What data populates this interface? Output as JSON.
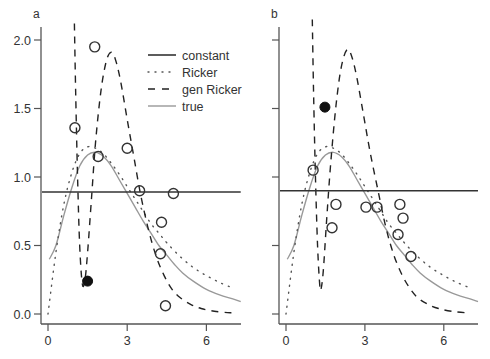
{
  "colors": {
    "axis": "#555555",
    "constant": "#333333",
    "ricker": "#555555",
    "gen_ricker": "#222222",
    "true": "#999999",
    "point_open": "#333333",
    "point_filled": "#111111"
  },
  "legend": {
    "entries": [
      {
        "label": "constant",
        "style": "solid"
      },
      {
        "label": "Ricker",
        "style": "dotted"
      },
      {
        "label": "gen Ricker",
        "style": "dashed"
      },
      {
        "label": "true",
        "style": "solid-gray"
      }
    ],
    "panel": "a"
  },
  "chart_data": [
    {
      "type": "scatter",
      "panel_label": "a",
      "title": "",
      "xlabel": "",
      "ylabel": "",
      "xlim": [
        -0.3,
        7.3
      ],
      "ylim": [
        -0.06,
        2.1
      ],
      "x_ticks": [
        0,
        3,
        6
      ],
      "y_ticks": [
        0.0,
        0.5,
        1.0,
        1.5,
        2.0
      ],
      "y_tick_labels": [
        "0.0",
        "0.5",
        "1.0",
        "1.5",
        "2.0"
      ],
      "grid": false,
      "legend_position": "upper right",
      "points_open": [
        [
          1.02,
          1.36
        ],
        [
          1.77,
          1.95
        ],
        [
          1.9,
          1.15
        ],
        [
          3.0,
          1.21
        ],
        [
          3.47,
          0.9
        ],
        [
          4.75,
          0.88
        ],
        [
          4.3,
          0.67
        ],
        [
          4.26,
          0.44
        ],
        [
          4.45,
          0.06
        ]
      ],
      "points_filled": [
        [
          1.5,
          0.24
        ]
      ],
      "series": [
        {
          "name": "constant",
          "x": [
            -0.3,
            7.3
          ],
          "y": [
            0.89,
            0.89
          ]
        },
        {
          "name": "Ricker",
          "x": [
            0,
            0.3,
            0.6,
            0.9,
            1.2,
            1.5,
            1.8,
            2.1,
            2.4,
            2.7,
            3.0,
            3.3,
            3.6,
            3.9,
            4.2,
            4.5,
            5.0,
            5.5,
            6.0,
            6.5,
            7.0
          ],
          "y": [
            0.0,
            0.45,
            0.8,
            1.03,
            1.17,
            1.22,
            1.21,
            1.17,
            1.1,
            1.02,
            0.93,
            0.84,
            0.75,
            0.66,
            0.59,
            0.52,
            0.42,
            0.34,
            0.28,
            0.23,
            0.19
          ]
        },
        {
          "name": "gen Ricker",
          "x": [
            1.0,
            1.05,
            1.12,
            1.2,
            1.3,
            1.4,
            1.5,
            1.65,
            1.8,
            2.0,
            2.2,
            2.38,
            2.55,
            2.75,
            3.0,
            3.25,
            3.5,
            3.8,
            4.1,
            4.4,
            4.7,
            5.0,
            5.4,
            5.8,
            6.3,
            6.8,
            7.0
          ],
          "y": [
            2.12,
            1.6,
            1.0,
            0.5,
            0.22,
            0.25,
            0.45,
            0.85,
            1.25,
            1.62,
            1.84,
            1.91,
            1.86,
            1.7,
            1.42,
            1.15,
            0.88,
            0.62,
            0.42,
            0.28,
            0.18,
            0.12,
            0.07,
            0.04,
            0.02,
            0.01,
            0.01
          ]
        },
        {
          "name": "true",
          "x": [
            0.05,
            0.3,
            0.6,
            0.9,
            1.2,
            1.5,
            1.8,
            2.1,
            2.4,
            2.7,
            3.0,
            3.3,
            3.6,
            3.9,
            4.2,
            4.5,
            4.8,
            5.1,
            5.5,
            6.0,
            6.5,
            7.0,
            7.3
          ],
          "y": [
            0.4,
            0.5,
            0.72,
            0.92,
            1.08,
            1.16,
            1.18,
            1.15,
            1.08,
            0.98,
            0.88,
            0.78,
            0.68,
            0.59,
            0.5,
            0.43,
            0.36,
            0.3,
            0.24,
            0.18,
            0.14,
            0.11,
            0.09
          ]
        }
      ]
    },
    {
      "type": "scatter",
      "panel_label": "b",
      "title": "",
      "xlabel": "",
      "ylabel": "",
      "xlim": [
        -0.3,
        7.3
      ],
      "ylim": [
        -0.06,
        2.1
      ],
      "x_ticks": [
        0,
        3,
        6
      ],
      "y_ticks": [
        0.0,
        0.5,
        1.0,
        1.5,
        2.0
      ],
      "y_tick_labels": [],
      "grid": false,
      "points_open": [
        [
          1.03,
          1.05
        ],
        [
          1.9,
          0.8
        ],
        [
          1.75,
          0.63
        ],
        [
          3.04,
          0.78
        ],
        [
          3.46,
          0.78
        ],
        [
          4.33,
          0.8
        ],
        [
          4.45,
          0.7
        ],
        [
          4.26,
          0.58
        ],
        [
          4.75,
          0.42
        ]
      ],
      "points_filled": [
        [
          1.48,
          1.51
        ]
      ],
      "series": [
        {
          "name": "constant",
          "x": [
            -0.3,
            7.3
          ],
          "y": [
            0.9,
            0.9
          ]
        },
        {
          "name": "Ricker",
          "x": [
            0,
            0.3,
            0.6,
            0.9,
            1.2,
            1.5,
            1.8,
            2.1,
            2.4,
            2.7,
            3.0,
            3.3,
            3.6,
            3.9,
            4.2,
            4.5,
            5.0,
            5.5,
            6.0,
            6.5,
            7.0
          ],
          "y": [
            0.0,
            0.45,
            0.8,
            1.03,
            1.17,
            1.22,
            1.21,
            1.17,
            1.1,
            1.02,
            0.93,
            0.84,
            0.75,
            0.66,
            0.59,
            0.52,
            0.42,
            0.34,
            0.28,
            0.23,
            0.19
          ]
        },
        {
          "name": "gen Ricker",
          "x": [
            1.0,
            1.05,
            1.12,
            1.2,
            1.28,
            1.33,
            1.42,
            1.55,
            1.7,
            1.9,
            2.1,
            2.32,
            2.5,
            2.7,
            2.95,
            3.2,
            3.5,
            3.8,
            4.1,
            4.4,
            4.7,
            5.0,
            5.4,
            5.8,
            6.3,
            6.8,
            7.0
          ],
          "y": [
            2.15,
            1.6,
            1.0,
            0.5,
            0.22,
            0.18,
            0.32,
            0.7,
            1.1,
            1.52,
            1.8,
            1.93,
            1.88,
            1.72,
            1.45,
            1.18,
            0.9,
            0.63,
            0.43,
            0.29,
            0.19,
            0.12,
            0.07,
            0.04,
            0.02,
            0.01,
            0.01
          ]
        },
        {
          "name": "true",
          "x": [
            0.05,
            0.3,
            0.6,
            0.9,
            1.2,
            1.5,
            1.8,
            2.1,
            2.4,
            2.7,
            3.0,
            3.3,
            3.6,
            3.9,
            4.2,
            4.5,
            4.8,
            5.1,
            5.5,
            6.0,
            6.5,
            7.0,
            7.3
          ],
          "y": [
            0.4,
            0.5,
            0.72,
            0.92,
            1.08,
            1.16,
            1.18,
            1.15,
            1.08,
            0.98,
            0.88,
            0.78,
            0.68,
            0.59,
            0.5,
            0.43,
            0.36,
            0.3,
            0.24,
            0.18,
            0.14,
            0.11,
            0.09
          ]
        }
      ]
    }
  ]
}
